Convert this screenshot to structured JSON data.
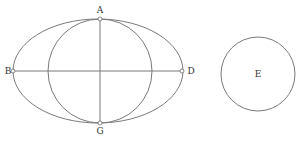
{
  "diagram": {
    "colors": {
      "stroke": "#7a7a7a",
      "label": "#333333",
      "background": "#ffffff"
    },
    "ellipse": {
      "cx": 98,
      "cy": 71,
      "rx": 85,
      "ry": 52
    },
    "inner_circle": {
      "cx": 100,
      "cy": 71,
      "r": 52
    },
    "circle_e": {
      "cx": 258,
      "cy": 74,
      "r": 37
    },
    "horizontal_line": {
      "x1": 13,
      "y1": 71,
      "x2": 182,
      "y2": 71
    },
    "vertical_line": {
      "x1": 100,
      "y1": 19,
      "x2": 100,
      "y2": 123
    },
    "points": [
      {
        "id": "A",
        "x": 100,
        "y": 19
      },
      {
        "id": "G",
        "x": 100,
        "y": 123
      },
      {
        "id": "B",
        "x": 13,
        "y": 71
      },
      {
        "id": "D",
        "x": 182,
        "y": 71
      }
    ],
    "labels": {
      "A": "A",
      "B": "B",
      "D": "D",
      "G": "G",
      "E": "E"
    }
  }
}
